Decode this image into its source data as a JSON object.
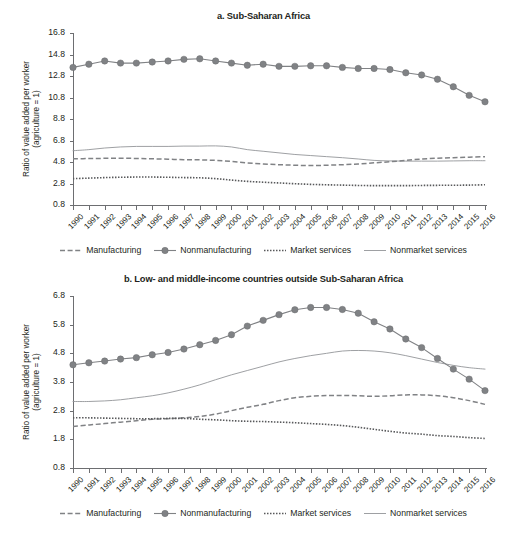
{
  "figure": {
    "ylabel_line1": "Ratio of value added per worker",
    "ylabel_line2": "(agriculture = 1)",
    "colors": {
      "nonmanufacturing": "#808285",
      "manufacturing": "#808285",
      "market_services": "#58595b",
      "nonmarket_services": "#939598",
      "axis": "#6d6e71",
      "text": "#231f20"
    },
    "legend": [
      {
        "label": "Manufacturing",
        "style": "dashed",
        "marker": "none",
        "icon": "dashed-line-icon"
      },
      {
        "label": "Nonmanufacturing",
        "style": "solid-marker",
        "marker": "circle",
        "icon": "line-with-circle-marker-icon"
      },
      {
        "label": "Market services",
        "style": "dotted",
        "marker": "none",
        "icon": "dotted-line-icon"
      },
      {
        "label": "Nonmarket services",
        "style": "thin-solid",
        "marker": "none",
        "icon": "thin-solid-line-icon"
      }
    ]
  },
  "chart_data": [
    {
      "type": "line",
      "panel": "a",
      "title": "a. Sub-Saharan Africa",
      "xlabel": "",
      "ylabel": "Ratio of value added per worker (agriculture = 1)",
      "grid": false,
      "legend_position": "bottom",
      "ylim": [
        0.8,
        16.8
      ],
      "yticks": [
        0.8,
        2.8,
        4.8,
        6.8,
        8.8,
        10.8,
        12.8,
        14.8,
        16.8
      ],
      "ytick_labels": [
        "0.8",
        "2.8",
        "4.8",
        "6.8",
        "8.8",
        "10.8",
        "12.8",
        "14.8",
        "16.8"
      ],
      "categories": [
        1990,
        1991,
        1992,
        1993,
        1994,
        1995,
        1996,
        1997,
        1998,
        1999,
        2000,
        2001,
        2002,
        2003,
        2004,
        2005,
        2006,
        2007,
        2008,
        2009,
        2010,
        2011,
        2012,
        2013,
        2014,
        2015,
        2016
      ],
      "xtick_labels": [
        "1990",
        "1991",
        "1992",
        "1993",
        "1994",
        "1995",
        "1996",
        "1997",
        "1998",
        "1999",
        "2000",
        "2001",
        "2002",
        "2003",
        "2004",
        "2005",
        "2006",
        "2007",
        "2008",
        "2009",
        "2010",
        "2011",
        "2012",
        "2013",
        "2014",
        "2015",
        "2016"
      ],
      "series": [
        {
          "name": "Nonmanufacturing",
          "style": "solid-marker",
          "values": [
            13.6,
            13.9,
            14.2,
            14.0,
            14.0,
            14.1,
            14.2,
            14.35,
            14.4,
            14.2,
            14.0,
            13.8,
            13.9,
            13.7,
            13.7,
            13.75,
            13.75,
            13.6,
            13.5,
            13.5,
            13.4,
            13.1,
            12.9,
            12.5,
            11.8,
            11.0,
            10.4
          ]
        },
        {
          "name": "Manufacturing",
          "style": "dashed",
          "values": [
            5.1,
            5.12,
            5.14,
            5.15,
            5.13,
            5.1,
            5.06,
            5.02,
            5.0,
            4.95,
            4.85,
            4.72,
            4.62,
            4.55,
            4.5,
            4.47,
            4.5,
            4.55,
            4.62,
            4.72,
            4.82,
            4.95,
            5.08,
            5.15,
            5.2,
            5.25,
            5.3
          ]
        },
        {
          "name": "Market services",
          "style": "dotted",
          "values": [
            3.25,
            3.3,
            3.35,
            3.38,
            3.4,
            3.4,
            3.38,
            3.35,
            3.33,
            3.25,
            3.12,
            3.0,
            2.92,
            2.85,
            2.78,
            2.72,
            2.68,
            2.65,
            2.62,
            2.6,
            2.6,
            2.6,
            2.62,
            2.63,
            2.64,
            2.65,
            2.68
          ]
        },
        {
          "name": "Nonmarket services",
          "style": "thin-solid",
          "values": [
            5.85,
            5.95,
            6.1,
            6.2,
            6.25,
            6.25,
            6.25,
            6.28,
            6.28,
            6.3,
            6.2,
            5.95,
            5.8,
            5.65,
            5.5,
            5.4,
            5.3,
            5.2,
            5.08,
            4.95,
            4.9,
            4.88,
            4.88,
            4.88,
            4.9,
            4.92,
            4.92
          ]
        }
      ]
    },
    {
      "type": "line",
      "panel": "b",
      "title": "b. Low- and middle-income countries outside Sub-Saharan Africa",
      "xlabel": "",
      "ylabel": "Ratio of value added per worker (agriculture = 1)",
      "grid": false,
      "legend_position": "bottom",
      "ylim": [
        0.8,
        6.8
      ],
      "yticks": [
        0.8,
        1.8,
        2.8,
        3.8,
        4.8,
        5.8,
        6.8
      ],
      "ytick_labels": [
        "0.8",
        "1.8",
        "2.8",
        "3.8",
        "4.8",
        "5.8",
        "6.8"
      ],
      "categories": [
        1990,
        1991,
        1992,
        1993,
        1994,
        1995,
        1996,
        1997,
        1998,
        1999,
        2000,
        2001,
        2002,
        2003,
        2004,
        2005,
        2006,
        2007,
        2008,
        2009,
        2010,
        2011,
        2012,
        2013,
        2014,
        2015,
        2016
      ],
      "xtick_labels": [
        "1990",
        "1991",
        "1992",
        "1993",
        "1994",
        "1995",
        "1996",
        "1997",
        "1998",
        "1999",
        "2000",
        "2001",
        "2002",
        "2003",
        "2004",
        "2005",
        "2006",
        "2007",
        "2008",
        "2009",
        "2010",
        "2011",
        "2012",
        "2013",
        "2014",
        "2015",
        "2016"
      ],
      "series": [
        {
          "name": "Nonmanufacturing",
          "style": "solid-marker",
          "values": [
            4.4,
            4.47,
            4.53,
            4.6,
            4.65,
            4.75,
            4.83,
            4.95,
            5.1,
            5.25,
            5.45,
            5.75,
            5.95,
            6.15,
            6.32,
            6.4,
            6.4,
            6.33,
            6.2,
            5.9,
            5.65,
            5.3,
            5.0,
            4.62,
            4.25,
            3.9,
            3.5
          ]
        },
        {
          "name": "Manufacturing",
          "style": "dashed",
          "values": [
            2.25,
            2.3,
            2.35,
            2.4,
            2.45,
            2.5,
            2.52,
            2.55,
            2.6,
            2.68,
            2.8,
            2.92,
            3.02,
            3.15,
            3.25,
            3.3,
            3.33,
            3.33,
            3.32,
            3.3,
            3.32,
            3.35,
            3.35,
            3.32,
            3.25,
            3.15,
            3.02
          ]
        },
        {
          "name": "Market services",
          "style": "dotted",
          "values": [
            2.55,
            2.55,
            2.54,
            2.53,
            2.52,
            2.52,
            2.53,
            2.53,
            2.5,
            2.48,
            2.45,
            2.43,
            2.42,
            2.4,
            2.38,
            2.35,
            2.32,
            2.28,
            2.22,
            2.15,
            2.08,
            2.02,
            1.98,
            1.93,
            1.9,
            1.86,
            1.83
          ]
        },
        {
          "name": "Nonmarket services",
          "style": "thin-solid",
          "values": [
            3.12,
            3.12,
            3.14,
            3.18,
            3.25,
            3.32,
            3.42,
            3.55,
            3.7,
            3.88,
            4.05,
            4.2,
            4.35,
            4.5,
            4.62,
            4.72,
            4.8,
            4.88,
            4.9,
            4.88,
            4.82,
            4.72,
            4.6,
            4.48,
            4.38,
            4.3,
            4.25
          ]
        }
      ]
    }
  ]
}
